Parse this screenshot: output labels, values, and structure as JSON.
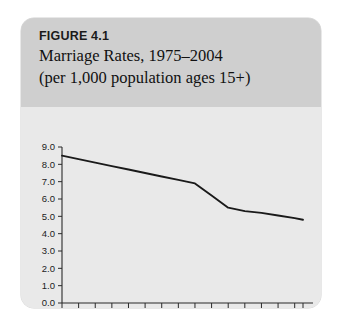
{
  "figure": {
    "number_label": "FIGURE 4.1",
    "title_line1": "Marriage Rates, 1975–2004",
    "title_line2": "(per 1,000 population ages 15+)"
  },
  "colors": {
    "card_background": "#e9e9e9",
    "header_background": "#cfcfcf",
    "line_color": "#1a1a1a",
    "axis_color": "#2b2b2b",
    "text_color": "#111111"
  },
  "chart_data": {
    "type": "line",
    "title": "Marriage Rates, 1975–2004",
    "subtitle": "(per 1,000 population ages 15+)",
    "xlabel": "",
    "ylabel": "",
    "xlim": [
      1975,
      2004
    ],
    "ylim": [
      0.0,
      9.0
    ],
    "grid": false,
    "legend": "none",
    "y_ticks": [
      "0.0",
      "1.0",
      "2.0",
      "3.0",
      "4.0",
      "5.0",
      "6.0",
      "7.0",
      "8.0",
      "9.0"
    ],
    "y_tick_values": [
      0.0,
      1.0,
      2.0,
      3.0,
      4.0,
      5.0,
      6.0,
      7.0,
      8.0,
      9.0
    ],
    "x_ticks": [
      "1975",
      "1979",
      "1983",
      "1987",
      "1991",
      "1995",
      "1999",
      "2003"
    ],
    "x_tick_values": [
      1975,
      1979,
      1983,
      1987,
      1991,
      1995,
      1999,
      2003
    ],
    "x_minor_tick_values": [
      1977,
      1981,
      1985,
      1989,
      1993,
      1997,
      2001,
      2004
    ],
    "x": [
      1975,
      1977,
      1979,
      1981,
      1983,
      1985,
      1987,
      1989,
      1991,
      1993,
      1995,
      1997,
      1999,
      2001,
      2003,
      2004
    ],
    "values": [
      8.5,
      8.3,
      8.1,
      7.9,
      7.7,
      7.5,
      7.3,
      7.1,
      6.9,
      6.2,
      5.5,
      5.3,
      5.2,
      5.05,
      4.9,
      4.8
    ],
    "series": [
      {
        "name": "Marriage rate per 1,000 population ages 15+",
        "values": [
          8.5,
          8.3,
          8.1,
          7.9,
          7.7,
          7.5,
          7.3,
          7.1,
          6.9,
          6.2,
          5.5,
          5.3,
          5.2,
          5.05,
          4.9,
          4.8
        ]
      }
    ]
  }
}
